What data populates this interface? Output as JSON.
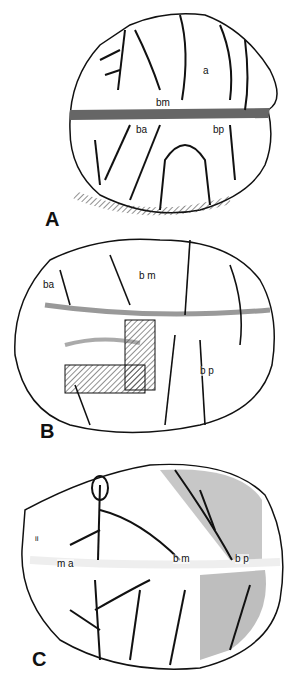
{
  "figure": {
    "panels": [
      {
        "id": "A",
        "label": "A",
        "annotations": [
          "a",
          "bm",
          "ba",
          "bp"
        ]
      },
      {
        "id": "B",
        "label": "B",
        "annotations": [
          "ba",
          "b m",
          "b p"
        ]
      },
      {
        "id": "C",
        "label": "C",
        "annotations": [
          "ii",
          "m a",
          "b m",
          "b p"
        ]
      }
    ]
  }
}
